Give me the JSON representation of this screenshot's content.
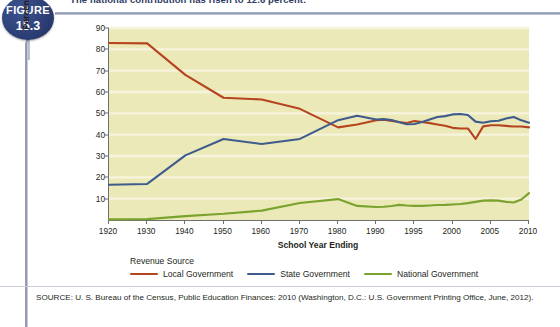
{
  "figure": {
    "badge_word": "FIGURE",
    "badge_number": "15.3",
    "caption": "The national contribution has risen to 12.6 percent."
  },
  "source_note": "SOURCE: U. S. Bureau of the Census, Public Education Finances: 2010 (Washington, D.C.: U.S. Government Printing Office, June, 2012).",
  "legend": {
    "title": "Revenue Source",
    "items": [
      {
        "label": "Local Government",
        "color": "#b5441f"
      },
      {
        "label": "State Government",
        "color": "#3f5b8c"
      },
      {
        "label": "National Government",
        "color": "#79a32e"
      }
    ]
  },
  "chart_data": {
    "type": "line",
    "title": "",
    "xlabel": "School Year Ending",
    "ylabel": "Percentage of Total Revenues",
    "ylim": [
      0,
      90
    ],
    "yticks": [
      10,
      20,
      30,
      40,
      50,
      60,
      70,
      80,
      90
    ],
    "grid": true,
    "legend_position": "bottom",
    "plot_background": "#ece9b9",
    "gridline_color": "#f7f4dd",
    "axis_color": "#6f6f6f",
    "xticks": [
      1920,
      1930,
      1940,
      1950,
      1960,
      1970,
      1980,
      1990,
      1995,
      2000,
      2005,
      2010
    ],
    "x_axis_note": "Uneven spacing: decades 1920-1990, then 5-year steps 1990-2010",
    "x": [
      1920,
      1930,
      1940,
      1950,
      1960,
      1970,
      1980,
      1985,
      1990,
      1991,
      1992,
      1993,
      1994,
      1995,
      1996,
      1997,
      1998,
      1999,
      2000,
      2001,
      2002,
      2003,
      2004,
      2005,
      2006,
      2007,
      2008,
      2009,
      2010
    ],
    "series": [
      {
        "name": "Local Government",
        "color": "#b5441f",
        "values": [
          83.0,
          82.8,
          68.0,
          57.3,
          56.5,
          52.1,
          43.4,
          44.8,
          46.8,
          47.0,
          46.4,
          45.9,
          45.5,
          46.4,
          45.9,
          45.4,
          44.8,
          44.2,
          43.2,
          42.9,
          42.9,
          38.0,
          43.9,
          44.4,
          44.4,
          44.1,
          43.8,
          43.8,
          43.4
        ]
      },
      {
        "name": "State Government",
        "color": "#3f5b8c",
        "values": [
          16.5,
          16.9,
          30.3,
          38.0,
          35.6,
          38.0,
          46.8,
          48.9,
          47.1,
          47.3,
          46.9,
          45.8,
          44.9,
          45.0,
          45.9,
          47.1,
          48.3,
          48.7,
          49.5,
          49.7,
          49.2,
          46.1,
          45.6,
          46.3,
          46.5,
          47.6,
          48.3,
          46.7,
          45.6
        ]
      },
      {
        "name": "National Government",
        "color": "#79a32e",
        "values": [
          0.3,
          0.4,
          1.8,
          2.9,
          4.4,
          8.0,
          9.8,
          6.6,
          6.1,
          6.2,
          6.6,
          7.1,
          6.8,
          6.6,
          6.6,
          6.8,
          7.0,
          7.1,
          7.3,
          7.5,
          7.9,
          8.5,
          9.1,
          9.2,
          9.1,
          8.5,
          8.2,
          9.6,
          12.6
        ]
      }
    ]
  }
}
